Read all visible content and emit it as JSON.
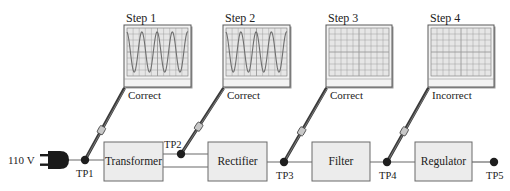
{
  "diagram": {
    "source": {
      "label": "110 V",
      "icon": "plug-icon"
    },
    "blocks": [
      {
        "id": "transformer",
        "label": "Transformer",
        "x": 104,
        "y": 142,
        "w": 59,
        "h": 39
      },
      {
        "id": "rectifier",
        "label": "Rectifier",
        "x": 208,
        "y": 142,
        "w": 59,
        "h": 39
      },
      {
        "id": "filter",
        "label": "Filter",
        "x": 312,
        "y": 142,
        "w": 58,
        "h": 39
      },
      {
        "id": "regulator",
        "label": "Regulator",
        "x": 415,
        "y": 142,
        "w": 57,
        "h": 39
      }
    ],
    "test_points": [
      {
        "id": "TP1",
        "label": "TP1",
        "x": 85,
        "y": 160,
        "lx": 76,
        "ly": 169
      },
      {
        "id": "TP2",
        "label": "TP2",
        "x": 181,
        "y": 154,
        "lx": 164,
        "ly": 140
      },
      {
        "id": "TP3",
        "label": "TP3",
        "x": 284,
        "y": 162,
        "lx": 276,
        "ly": 171
      },
      {
        "id": "TP4",
        "label": "TP4",
        "x": 387,
        "y": 162,
        "lx": 379,
        "ly": 171
      },
      {
        "id": "TP5",
        "label": "TP5",
        "x": 494,
        "y": 162,
        "lx": 486,
        "ly": 171
      }
    ],
    "steps": [
      {
        "label": "Step 1",
        "result": "Correct",
        "waveform": "sine",
        "test_point": "TP1",
        "scope": {
          "x": 124,
          "y": 25,
          "w": 67,
          "h": 62
        }
      },
      {
        "label": "Step 2",
        "result": "Correct",
        "waveform": "sine",
        "test_point": "TP2",
        "scope": {
          "x": 223,
          "y": 25,
          "w": 67,
          "h": 62
        }
      },
      {
        "label": "Step 3",
        "result": "Correct",
        "waveform": "none",
        "test_point": "TP3",
        "scope": {
          "x": 326,
          "y": 25,
          "w": 66,
          "h": 62
        }
      },
      {
        "label": "Step 4",
        "result": "Incorrect",
        "waveform": "none",
        "test_point": "TP4",
        "scope": {
          "x": 428,
          "y": 25,
          "w": 66,
          "h": 62
        }
      }
    ],
    "colors": {
      "block_fill": "#ececec",
      "block_stroke": "#6a6a6a",
      "wire": "#6a6a6a",
      "screen_fill": "#e6e6e6",
      "grid": "#9a9a9a",
      "trace": "#6e6e6e",
      "probe": "#3a3a3a",
      "dot": "#1e1e1e"
    }
  }
}
